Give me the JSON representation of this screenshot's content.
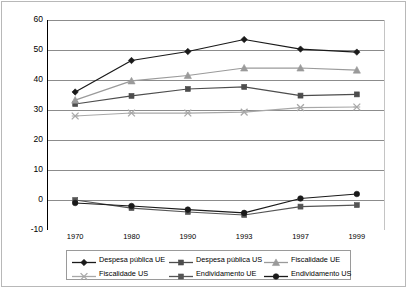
{
  "chart_data": {
    "type": "line",
    "title": "",
    "subtitle": "",
    "xlabel": "",
    "ylabel": "",
    "categories": [
      "1970",
      "1980",
      "1990",
      "1993",
      "1997",
      "1999"
    ],
    "ylim": [
      -10,
      60
    ],
    "ytick_values": [
      60,
      50,
      40,
      30,
      20,
      10,
      0,
      -10
    ],
    "ytick_labels": [
      "60",
      "50",
      "40",
      "30",
      "20",
      "10",
      "0",
      "-10"
    ],
    "grid": "horizontal",
    "legend_position": "bottom",
    "series": [
      {
        "name": "Despesa pública UE",
        "marker": "diamond",
        "color": "#1a1a1a",
        "values": [
          36.0,
          46.5,
          49.5,
          53.5,
          50.3,
          49.3
        ]
      },
      {
        "name": "Despesa pública US",
        "marker": "square",
        "color": "#4d4d4d",
        "values": [
          32.0,
          34.7,
          37.0,
          37.7,
          34.8,
          35.2
        ]
      },
      {
        "name": "Fiscalidade UE",
        "marker": "triangle",
        "color": "#9a9a9a",
        "values": [
          33.3,
          39.7,
          41.5,
          44.0,
          44.0,
          43.3
        ]
      },
      {
        "name": "Fiscalidade US",
        "marker": "cross",
        "color": "#a8a8a8",
        "values": [
          28.0,
          29.0,
          29.0,
          29.3,
          30.8,
          31.0
        ]
      },
      {
        "name": "Endividamento UE",
        "marker": "square",
        "color": "#555555",
        "values": [
          0.0,
          -2.7,
          -4.0,
          -5.0,
          -2.2,
          -1.7
        ]
      },
      {
        "name": "Endividamento US",
        "marker": "circle",
        "color": "#1a1a1a",
        "values": [
          -1.0,
          -2.0,
          -3.2,
          -4.3,
          0.5,
          2.0
        ]
      }
    ]
  },
  "legend": {
    "entries": [
      {
        "label": "Despesa pública UE"
      },
      {
        "label": "Despesa pública US"
      },
      {
        "label": "Fiscalidade UE"
      },
      {
        "label": "Fiscalidade US"
      },
      {
        "label": "Endividamento UE"
      },
      {
        "label": "Endividamento US"
      }
    ]
  },
  "colors": {
    "gridline": "#808080",
    "axis": "#000000",
    "frame": "#b8b8b8",
    "background": "#ffffff"
  }
}
